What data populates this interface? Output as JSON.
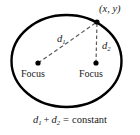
{
  "figure": {
    "ellipse": {
      "cx": 66.5,
      "cy": 61,
      "rx": 55,
      "ry": 46,
      "stroke_color": "#000000",
      "stroke_width": 2.4,
      "fill": "none"
    },
    "point_on_ellipse": {
      "label": "(x, y)",
      "x": 97,
      "y": 22,
      "dot_radius": 2.6,
      "dot_color": "#000000"
    },
    "focus_left": {
      "label": "Focus",
      "x": 38,
      "y": 63,
      "dot_radius": 2.6,
      "dot_color": "#000000"
    },
    "focus_right": {
      "label": "Focus",
      "x": 96,
      "y": 63,
      "dot_radius": 2.6,
      "dot_color": "#000000"
    },
    "segment_d1": {
      "label_base": "d",
      "label_sub": "1",
      "from_x": 38,
      "from_y": 63,
      "to_x": 97,
      "to_y": 22,
      "style": "dashed",
      "dash_pattern": "4,2.6",
      "stroke_color": "#5a5a5a",
      "stroke_width": 1.2
    },
    "segment_d2": {
      "label_base": "d",
      "label_sub": "2",
      "from_x": 96,
      "from_y": 63,
      "to_x": 97,
      "to_y": 22,
      "style": "dashed",
      "dash_pattern": "3.4,2.6",
      "stroke_color": "#5a5a5a",
      "stroke_width": 1.2
    },
    "equation": {
      "d1_base": "d",
      "d1_sub": "1",
      "plus": "+",
      "d2_base": "d",
      "d2_sub": "2",
      "equals": "=",
      "constant": "constant"
    },
    "colors": {
      "background": "#ffffff",
      "ink": "#000000",
      "dashed": "#5a5a5a",
      "text": "#1a1a1a"
    }
  }
}
